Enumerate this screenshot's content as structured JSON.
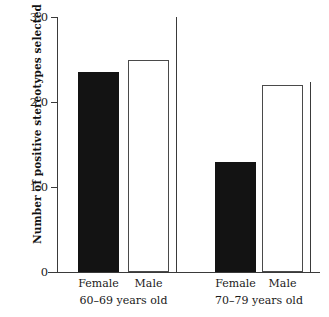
{
  "chart_data": {
    "type": "bar",
    "title": "",
    "xlabel": "",
    "ylabel": "Number of positive stereotypes selected",
    "ylim": [
      0,
      3.0
    ],
    "ytick_labels": [
      "0",
      "1.0",
      "2.0",
      "3.0"
    ],
    "ytick_values": [
      0,
      1.0,
      2.0,
      3.0
    ],
    "grid": false,
    "legend": "none",
    "categories": [
      "60–69 years old",
      "70–79 years old"
    ],
    "series": [
      {
        "name": "Female",
        "values": [
          2.35,
          1.3
        ],
        "style": "filled",
        "color": "#131313"
      },
      {
        "name": "Male",
        "values": [
          2.5,
          2.2
        ],
        "style": "open",
        "color": "#ffffff"
      }
    ],
    "bars": [
      {
        "group": "60–69 years old",
        "series": "Female",
        "value": 2.35,
        "style": "filled"
      },
      {
        "group": "60–69 years old",
        "series": "Male",
        "value": 2.5,
        "style": "open"
      },
      {
        "group": "70–79 years old",
        "series": "Female",
        "value": 1.3,
        "style": "filled"
      },
      {
        "group": "70–79 years old",
        "series": "Male",
        "value": 2.2,
        "style": "open"
      }
    ]
  },
  "axis": {
    "y_title": "Number of positive stereotypes selected",
    "ticks": [
      {
        "label": "3.0",
        "value": 3.0
      },
      {
        "label": "2.0",
        "value": 2.0
      },
      {
        "label": "1.0",
        "value": 1.0
      },
      {
        "label": "0",
        "value": 0
      }
    ]
  },
  "groups": [
    {
      "label": "60–69 years old",
      "bars": [
        {
          "label": "Female",
          "value": 2.35,
          "style": "filled"
        },
        {
          "label": "Male",
          "value": 2.5,
          "style": "open"
        }
      ]
    },
    {
      "label": "70–79 years old",
      "bars": [
        {
          "label": "Female",
          "value": 1.3,
          "style": "filled"
        },
        {
          "label": "Male",
          "value": 2.2,
          "style": "open"
        }
      ]
    }
  ]
}
